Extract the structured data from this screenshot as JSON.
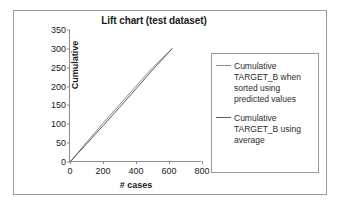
{
  "chart_data": {
    "type": "line",
    "title": "Lift chart (test dataset)",
    "xlabel": "# cases",
    "ylabel": "Cumulative",
    "xlim": [
      0,
      800
    ],
    "ylim": [
      0,
      350
    ],
    "xticks": [
      0,
      200,
      400,
      600,
      800
    ],
    "yticks": [
      0,
      50,
      100,
      150,
      200,
      250,
      300,
      350
    ],
    "grid": false,
    "legend_position": "right",
    "series": [
      {
        "name": "Cumulative TARGET_B when sorted using predicted values",
        "color": "#8d8d8d",
        "x": [
          0,
          100,
          200,
          300,
          400,
          500,
          620
        ],
        "y": [
          0,
          52,
          103,
          152,
          201,
          250,
          301
        ]
      },
      {
        "name": "Cumulative TARGET_B using average",
        "color": "#5a5a5a",
        "x": [
          0,
          100,
          200,
          300,
          400,
          500,
          620
        ],
        "y": [
          0,
          48,
          96,
          145,
          194,
          244,
          301
        ]
      }
    ]
  },
  "chart": {
    "title": "Lift chart (test dataset)",
    "x_axis_title": "# cases",
    "y_axis_title": "Cumulative",
    "x_tick_labels": [
      "0",
      "200",
      "400",
      "600",
      "800"
    ],
    "y_tick_labels": [
      "350",
      "300",
      "250",
      "200",
      "150",
      "100",
      "50",
      "0"
    ]
  },
  "legend": {
    "entries": [
      {
        "label": "Cumulative TARGET_B when sorted using predicted values",
        "color": "#8d8d8d"
      },
      {
        "label": "Cumulative TARGET_B using average",
        "color": "#5a5a5a"
      }
    ]
  }
}
